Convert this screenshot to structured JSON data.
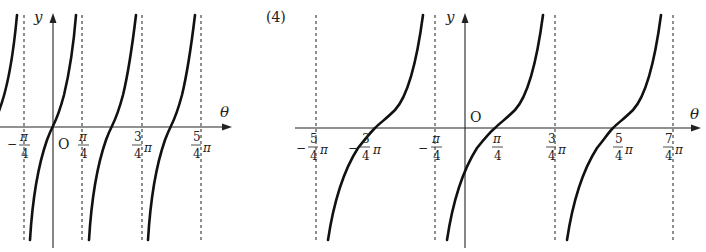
{
  "figure": {
    "part_label": "(4)",
    "left_graph": {
      "function": "y = tan 2θ",
      "y_axis_label": "y",
      "x_axis_label": "θ",
      "origin_label": "O",
      "ticks": [
        {
          "sign": "−",
          "num": "π",
          "den": "4",
          "suffix": ""
        },
        {
          "sign": "",
          "num": "π",
          "den": "4",
          "suffix": ""
        },
        {
          "sign": "",
          "num": "3",
          "den": "4",
          "suffix": "π"
        },
        {
          "sign": "",
          "num": "5",
          "den": "4",
          "suffix": "π"
        }
      ],
      "asymptotes": [
        "-π/4",
        "π/4",
        "3π/4",
        "5π/4"
      ]
    },
    "right_graph": {
      "function": "y = tan(θ − π/4)",
      "y_axis_label": "y",
      "x_axis_label": "θ",
      "origin_label": "O",
      "ticks": [
        {
          "sign": "−",
          "num": "5",
          "den": "4",
          "suffix": "π"
        },
        {
          "sign": "−",
          "num": "3",
          "den": "4",
          "suffix": "π"
        },
        {
          "sign": "−",
          "num": "π",
          "den": "4",
          "suffix": ""
        },
        {
          "sign": "",
          "num": "π",
          "den": "4",
          "suffix": ""
        },
        {
          "sign": "",
          "num": "3",
          "den": "4",
          "suffix": "π"
        },
        {
          "sign": "",
          "num": "5",
          "den": "4",
          "suffix": "π"
        },
        {
          "sign": "",
          "num": "7",
          "den": "4",
          "suffix": "π"
        }
      ],
      "asymptotes": [
        "-5π/4",
        "-π/4",
        "3π/4",
        "7π/4"
      ]
    }
  }
}
